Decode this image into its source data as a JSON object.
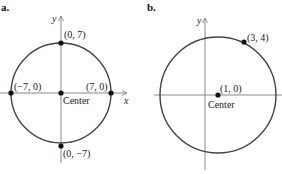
{
  "panels": [
    {
      "id": "a",
      "label": "a.",
      "axes": {
        "x_label": "x",
        "y_label": "y"
      },
      "center_label": "Center",
      "points": [
        {
          "label": "(0, 7)",
          "x": 0,
          "y": 7
        },
        {
          "label": "(−7, 0)",
          "x": -7,
          "y": 0
        },
        {
          "label": "(7, 0)",
          "x": 7,
          "y": 0
        },
        {
          "label": "(0, −7)",
          "x": 0,
          "y": -7
        },
        {
          "label": "",
          "x": 0,
          "y": 0
        }
      ],
      "circle": {
        "center": [
          0,
          0
        ],
        "radius": 7
      }
    },
    {
      "id": "b",
      "label": "b.",
      "axes": {
        "x_label": "",
        "y_label": "y"
      },
      "center_label": "Center",
      "points": [
        {
          "label": "(3, 4)",
          "x": 3,
          "y": 4
        },
        {
          "label": "(1, 0)",
          "x": 1,
          "y": 0
        }
      ],
      "circle": {
        "center": [
          1,
          0
        ],
        "radius": 4.47
      }
    }
  ],
  "colors": {
    "circle": "#444444",
    "axis": "#8a8a8a",
    "point": "#111111"
  }
}
